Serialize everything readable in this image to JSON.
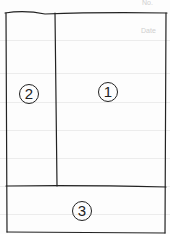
{
  "header": {
    "no_label": "No.",
    "date_label": "Date"
  },
  "sections": [
    {
      "id": "main-notes",
      "label": "1"
    },
    {
      "id": "cue-column",
      "label": "2"
    },
    {
      "id": "summary",
      "label": "3"
    }
  ],
  "colors": {
    "ink": "#222222",
    "rule": "#ececec",
    "print": "#cfcfcf"
  }
}
